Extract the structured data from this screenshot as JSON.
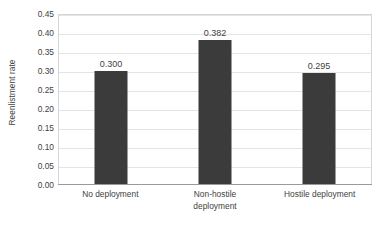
{
  "chart_data": {
    "type": "bar",
    "title": "",
    "subtitle": "",
    "xlabel": "",
    "ylabel": "Reenlistment rate",
    "categories": [
      "No deployment",
      "Non-hostile deployment",
      "Hostile deployment"
    ],
    "category_lines": [
      [
        "No deployment"
      ],
      [
        "Non-hostile",
        "deployment"
      ],
      [
        "Hostile deployment"
      ]
    ],
    "values": [
      0.3,
      0.382,
      0.295
    ],
    "value_labels": [
      "0.300",
      "0.382",
      "0.295"
    ],
    "ylim": [
      0.0,
      0.45
    ],
    "ytick_step": 0.05,
    "ytick_labels": [
      "0.00",
      "0.05",
      "0.10",
      "0.15",
      "0.20",
      "0.25",
      "0.30",
      "0.35",
      "0.40",
      "0.45"
    ],
    "ytick_values": [
      0.0,
      0.05,
      0.1,
      0.15,
      0.2,
      0.25,
      0.3,
      0.35,
      0.4,
      0.45
    ],
    "grid": true,
    "grid_orientation": "horizontal",
    "legend": false,
    "legend_position": "none",
    "bar_color": "#3b3b3b",
    "gridline_color": "#e4e4e4",
    "plot_border_color": "#d6d6d6",
    "axis_line_color": "#9a9a9a",
    "background_color": "#ffffff",
    "text_color": "#3f3f3f"
  }
}
